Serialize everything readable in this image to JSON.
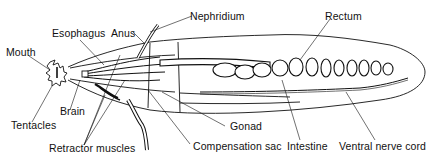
{
  "diagram": {
    "labels": {
      "mouth": "Mouth",
      "esophagus": "Esophagus",
      "anus": "Anus",
      "nephridium": "Nephridium",
      "rectum": "Rectum",
      "tentacles": "Tentacles",
      "brain": "Brain",
      "retractor_muscles": "Retractor muscles",
      "gonad": "Gonad",
      "compensation_sac": "Compensation sac",
      "intestine": "Intestine",
      "ventral_nerve_cord": "Ventral nerve cord"
    },
    "colors": {
      "ink": "#111111",
      "background": "#ffffff"
    }
  }
}
